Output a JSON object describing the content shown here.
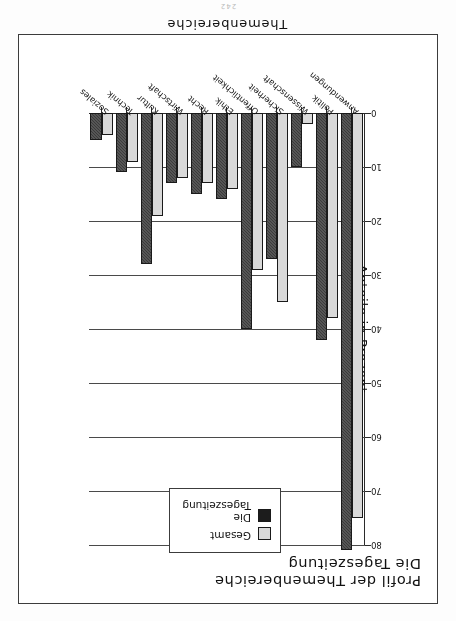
{
  "page": {
    "number": "242"
  },
  "chart_data": {
    "type": "bar",
    "title": "Profil der Themenbereiche",
    "subtitle": "Die Tageszeitung",
    "xlabel": "Themenbereiche",
    "ylabel": "Anteile in Prozent",
    "ylim": [
      0,
      80
    ],
    "yticks": [
      0,
      10,
      20,
      30,
      40,
      50,
      60,
      70,
      80
    ],
    "ytick_labels": [
      "0",
      "10",
      "20",
      "30",
      "40",
      "50",
      "60",
      "70",
      "80"
    ],
    "grid": true,
    "legend_position": "top-left-inside",
    "categories": [
      "Anwendungen",
      "Politik",
      "Wissenschaft",
      "Sicherheit",
      "Öffentlichkeit",
      "Ethik",
      "Recht",
      "Wirtschaft",
      "Kultur",
      "Technik",
      "Soziales"
    ],
    "series": [
      {
        "name": "Gesamt",
        "color": "#d9d9d9",
        "values": [
          75,
          38,
          2,
          35,
          29,
          14,
          13,
          12,
          19,
          9,
          4
        ]
      },
      {
        "name": "Die Tageszeitung",
        "color": "#1c1c1c",
        "values": [
          81,
          42,
          10,
          27,
          40,
          16,
          15,
          13,
          28,
          11,
          5
        ]
      }
    ]
  }
}
